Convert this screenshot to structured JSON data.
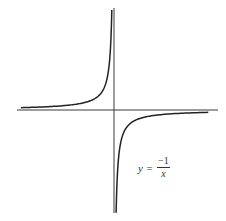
{
  "chart_data": {
    "type": "line",
    "title": "",
    "function": "y = -1/x",
    "xlabel": "",
    "ylabel": "",
    "grid": false,
    "legend": null,
    "axes": {
      "origin_px": [
        114,
        110
      ],
      "x_axis_px": [
        17,
        218
      ],
      "y_axis_px": [
        8,
        213
      ],
      "ticks": false
    },
    "series": [
      {
        "name": "y = -1/x (x < 0 branch)",
        "x": [
          -8,
          -6,
          -4,
          -3,
          -2,
          -1.5,
          -1,
          -0.75,
          -0.5,
          -0.4,
          -0.3,
          -0.25,
          -0.2
        ],
        "values": [
          0.125,
          0.167,
          0.25,
          0.333,
          0.5,
          0.667,
          1,
          1.333,
          2,
          2.5,
          3.333,
          4,
          5
        ]
      },
      {
        "name": "y = -1/x (x > 0 branch)",
        "x": [
          0.2,
          0.25,
          0.3,
          0.4,
          0.5,
          0.75,
          1,
          1.5,
          2,
          3,
          4,
          6,
          8
        ],
        "values": [
          -5,
          -4,
          -3.333,
          -2.5,
          -2,
          -1.333,
          -1,
          -0.667,
          -0.5,
          -0.333,
          -0.25,
          -0.167,
          -0.125
        ]
      }
    ],
    "annotations": [
      {
        "text": "y = −1/x",
        "position_px": [
          140,
          168
        ]
      }
    ]
  },
  "label": {
    "lhs": "y =",
    "numerator": "−1",
    "denominator": "x"
  },
  "colors": {
    "axis": "#3a3a3a",
    "curve": "#222222",
    "background": "#ffffff"
  }
}
